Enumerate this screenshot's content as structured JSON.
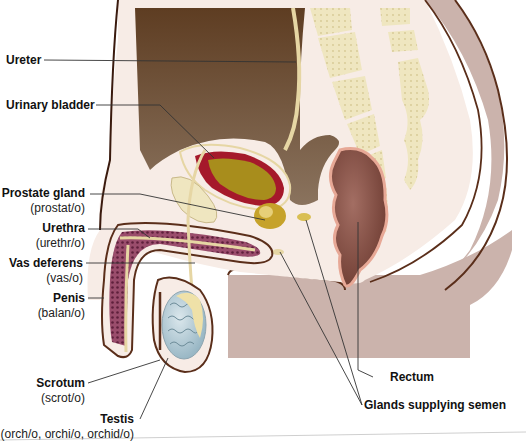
{
  "diagram": {
    "colors": {
      "background": "#ffffff",
      "body_outline": "#5a2e1a",
      "skin_tissue": "#f7ece6",
      "abdominal_cavity": "#7a5e45",
      "abdominal_cavity_dark": "#5e4530",
      "lower_body": "#cbb3ac",
      "bone": "#efe6c0",
      "bladder_wall": "#a5192b",
      "bladder_lumen": "#a88d1c",
      "duct": "#e6d6a4",
      "rectum": "#8e5549",
      "rectum_rim": "#e7a896",
      "erectile_tissue": "#8a3f5e",
      "testis": "#b6cdd6",
      "leader_line": "#333333"
    }
  },
  "labels": {
    "ureter": {
      "term": "Ureter",
      "root": ""
    },
    "urinary_bladder": {
      "term": "Urinary bladder",
      "root": ""
    },
    "prostate_gland": {
      "term": "Prostate gland",
      "root": "(prostat/o)"
    },
    "urethra": {
      "term": "Urethra",
      "root": "(urethr/o)"
    },
    "vas_deferens": {
      "term": "Vas deferens",
      "root": "(vas/o)"
    },
    "penis": {
      "term": "Penis",
      "root": "(balan/o)"
    },
    "scrotum": {
      "term": "Scrotum",
      "root": "(scrot/o)"
    },
    "testis": {
      "term": "Testis",
      "root": "(orch/o, orchi/o, orchid/o)"
    },
    "rectum": {
      "term": "Rectum",
      "root": ""
    },
    "glands_supplying_semen": {
      "term": "Glands supplying semen",
      "root": ""
    }
  }
}
